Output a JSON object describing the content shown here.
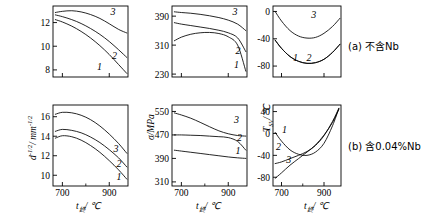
{
  "figure": {
    "type": "multi-panel-line-chart",
    "rows": 2,
    "cols": 3,
    "background": "#ffffff",
    "line_color": "#000000"
  },
  "row_captions": [
    {
      "id": "a",
      "text": "(a) 不含Nb"
    },
    {
      "id": "b",
      "text": "(b) 含0.04%Nb"
    }
  ],
  "axis_titles": {
    "x_t": "t",
    "x_t_sub": "终",
    "x_unit": "/ ℃",
    "y_d": "d",
    "y_d_exp": "-1/2",
    "y_d_unit": "/ mm",
    "y_d_unit_exp": "-1/2",
    "y_sigma": "σ/MPa",
    "y_tsv": "T",
    "y_tsv_sub": "SV",
    "y_tsv_unit": "/ ℃"
  },
  "curve_labels": [
    "1",
    "2",
    "3"
  ],
  "chart_data": [
    {
      "id": "panel-a-grainsize",
      "type": "line",
      "title": "",
      "xlabel": "t终/℃",
      "ylabel": "d^-1/2 / mm^-1/2",
      "xlim": [
        660,
        980
      ],
      "ylim": [
        7.4,
        13.4
      ],
      "xticks": [
        700,
        900
      ],
      "yticks": [
        8,
        10,
        12
      ],
      "grid": false,
      "legend": "inline-curve-numbers",
      "series": [
        {
          "name": "1",
          "x": [
            670,
            700,
            740,
            780,
            820,
            860,
            900,
            940,
            975
          ],
          "y": [
            12.25,
            12.05,
            11.7,
            11.25,
            10.7,
            10.05,
            9.3,
            8.45,
            7.7
          ]
        },
        {
          "name": "2",
          "x": [
            670,
            700,
            740,
            780,
            820,
            860,
            900,
            940,
            975
          ],
          "y": [
            12.65,
            12.5,
            12.25,
            11.92,
            11.5,
            11.0,
            10.4,
            9.7,
            9.05
          ]
        },
        {
          "name": "3",
          "x": [
            670,
            700,
            740,
            780,
            820,
            860,
            900,
            940,
            975
          ],
          "y": [
            12.85,
            12.95,
            13.0,
            12.9,
            12.68,
            12.35,
            11.9,
            11.42,
            11.12
          ]
        }
      ]
    },
    {
      "id": "panel-a-strength",
      "type": "line",
      "title": "",
      "xlabel": "t终/℃",
      "ylabel": "σ/MPa",
      "xlim": [
        660,
        980
      ],
      "ylim": [
        222,
        418
      ],
      "xticks": [
        700,
        900
      ],
      "yticks": [
        230,
        310,
        390
      ],
      "grid": false,
      "legend": "inline-curve-numbers",
      "series": [
        {
          "name": "1",
          "x": [
            670,
            700,
            740,
            780,
            820,
            860,
            900,
            940,
            975
          ],
          "y": [
            322,
            332,
            340,
            344,
            345,
            342,
            333,
            310,
            238
          ]
        },
        {
          "name": "2",
          "x": [
            670,
            700,
            740,
            780,
            820,
            860,
            900,
            940,
            975
          ],
          "y": [
            372,
            368,
            364,
            360,
            356,
            351,
            344,
            330,
            292
          ]
        },
        {
          "name": "3",
          "x": [
            670,
            700,
            740,
            780,
            820,
            860,
            900,
            940,
            975
          ],
          "y": [
            402,
            400,
            398,
            395,
            391,
            386,
            379,
            368,
            350
          ]
        }
      ]
    },
    {
      "id": "panel-a-tsv",
      "type": "line",
      "title": "",
      "xlabel": "t终/℃",
      "ylabel": "T_SV/℃",
      "xlim": [
        660,
        980
      ],
      "ylim": [
        -96,
        8
      ],
      "xticks": [
        700,
        900
      ],
      "yticks": [
        0,
        -40,
        -80
      ],
      "grid": false,
      "legend": "inline-curve-numbers",
      "series": [
        {
          "name": "1",
          "x": [
            670,
            700,
            740,
            780,
            820,
            860,
            900,
            940,
            975
          ],
          "y": [
            0,
            -14,
            -28,
            -36,
            -39,
            -38,
            -32,
            -22,
            -10
          ]
        },
        {
          "name": "2",
          "x": [
            670,
            700,
            740,
            780,
            820,
            860,
            900,
            940,
            975
          ],
          "y": [
            -42,
            -54,
            -66,
            -73,
            -76,
            -75,
            -70,
            -60,
            -48
          ]
        },
        {
          "name": "3",
          "x": [
            670,
            700,
            740,
            780,
            820,
            860,
            900,
            940,
            975
          ],
          "y": [
            -42,
            -54,
            -66,
            -73,
            -76,
            -75,
            -70,
            -60,
            -48
          ]
        }
      ]
    },
    {
      "id": "panel-b-grainsize",
      "type": "line",
      "title": "",
      "xlabel": "t终/℃",
      "ylabel": "d^-1/2 / mm^-1/2",
      "xlim": [
        660,
        980
      ],
      "ylim": [
        8.9,
        17.2
      ],
      "xticks": [
        700,
        900
      ],
      "yticks": [
        10,
        12,
        14,
        16
      ],
      "grid": false,
      "legend": "inline-curve-numbers",
      "series": [
        {
          "name": "1",
          "x": [
            670,
            700,
            740,
            780,
            820,
            860,
            900,
            940,
            975
          ],
          "y": [
            13.8,
            14.05,
            13.95,
            13.6,
            13.05,
            12.35,
            11.5,
            10.55,
            9.6
          ]
        },
        {
          "name": "2",
          "x": [
            670,
            700,
            740,
            780,
            820,
            860,
            900,
            940,
            975
          ],
          "y": [
            14.5,
            14.7,
            14.6,
            14.35,
            13.92,
            13.35,
            12.62,
            11.78,
            10.85
          ]
        },
        {
          "name": "3",
          "x": [
            670,
            700,
            740,
            780,
            820,
            860,
            900,
            940,
            975
          ],
          "y": [
            16.25,
            16.45,
            16.4,
            16.15,
            15.7,
            15.05,
            14.22,
            13.25,
            12.25
          ]
        }
      ]
    },
    {
      "id": "panel-b-strength",
      "type": "line",
      "title": "",
      "xlabel": "t终/℃",
      "ylabel": "σ/MPa",
      "xlim": [
        660,
        980
      ],
      "ylim": [
        296,
        572
      ],
      "xticks": [
        700,
        900
      ],
      "yticks": [
        310,
        390,
        470,
        550
      ],
      "grid": false,
      "legend": "inline-curve-numbers",
      "series": [
        {
          "name": "1",
          "x": [
            670,
            700,
            740,
            780,
            820,
            860,
            900,
            940,
            975
          ],
          "y": [
            418,
            415,
            411,
            407,
            403,
            399,
            395,
            392,
            390
          ]
        },
        {
          "name": "2",
          "x": [
            670,
            700,
            740,
            780,
            820,
            860,
            900,
            940,
            975
          ],
          "y": [
            470,
            470,
            469,
            468,
            466,
            464,
            461,
            448,
            418
          ]
        },
        {
          "name": "3",
          "x": [
            670,
            700,
            740,
            780,
            820,
            860,
            900,
            940,
            975
          ],
          "y": [
            545,
            538,
            527,
            513,
            498,
            484,
            474,
            468,
            466
          ]
        }
      ]
    },
    {
      "id": "panel-b-tsv",
      "type": "line",
      "title": "",
      "xlabel": "t终/℃",
      "ylabel": "T_SV/℃",
      "xlim": [
        660,
        980
      ],
      "ylim": [
        -96,
        52
      ],
      "xticks": [
        700,
        900
      ],
      "yticks": [
        40,
        0,
        -40,
        -80
      ],
      "grid": false,
      "legend": "inline-curve-numbers",
      "series": [
        {
          "name": "1",
          "x": [
            670,
            700,
            740,
            780,
            820,
            860,
            900,
            940,
            970
          ],
          "y": [
            2,
            -14,
            -30,
            -38,
            -40,
            -34,
            -18,
            14,
            46
          ]
        },
        {
          "name": "2",
          "x": [
            670,
            700,
            740,
            780,
            820,
            860,
            900,
            940,
            970
          ],
          "y": [
            -55,
            -52,
            -46,
            -40,
            -33,
            -22,
            -4,
            22,
            46
          ]
        },
        {
          "name": "3",
          "x": [
            670,
            700,
            740,
            780,
            820,
            860,
            900,
            940,
            970
          ],
          "y": [
            -82,
            -72,
            -58,
            -46,
            -34,
            -21,
            -3,
            20,
            44
          ]
        }
      ]
    }
  ]
}
